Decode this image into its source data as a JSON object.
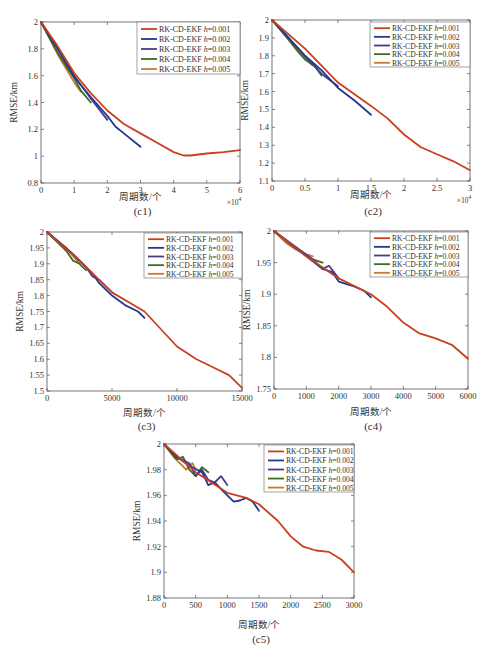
{
  "legend_labels": [
    "RK-CD-EKF h=0.001",
    "RK-CD-EKF h=0.002",
    "RK-CD-EKF h=0.003",
    "RK-CD-EKF h=0.004",
    "RK-CD-EKF h=0.005"
  ],
  "series_colors": [
    "#c8401e",
    "#1f3a8f",
    "#4a3a8c",
    "#3d6b24",
    "#c87a32"
  ],
  "chart_data": [
    {
      "type": "line",
      "panel": "(c1)",
      "xlabel": "周期数/个",
      "ylabel": "RMSE/km",
      "xlim": [
        0,
        60000
      ],
      "ylim": [
        0.8,
        2
      ],
      "x_exponent": "×10^4",
      "xticks": [
        0,
        10000,
        20000,
        30000,
        40000,
        50000,
        60000
      ],
      "xtick_labels": [
        "0",
        "1",
        "2",
        "3",
        "4",
        "5",
        "6"
      ],
      "yticks": [
        0.8,
        1,
        1.2,
        1.4,
        1.6,
        1.8,
        2
      ],
      "ytick_labels": [
        "0.8",
        "1",
        "1.2",
        "1.4",
        "1.6",
        "1.8",
        "2"
      ],
      "legend_position": "upper right",
      "series": [
        {
          "name": "RK-CD-EKF h=0.001",
          "x": [
            0,
            5000,
            10000,
            15000,
            20000,
            25000,
            30000,
            35000,
            40000,
            43000,
            45000,
            50000,
            55000,
            60000
          ],
          "y": [
            2,
            1.82,
            1.62,
            1.47,
            1.34,
            1.24,
            1.17,
            1.1,
            1.03,
            1.005,
            1.005,
            1.02,
            1.03,
            1.045
          ]
        },
        {
          "name": "RK-CD-EKF h=0.002",
          "x": [
            0,
            5000,
            10000,
            15000,
            20000,
            22500,
            25000,
            30000
          ],
          "y": [
            2,
            1.8,
            1.59,
            1.44,
            1.3,
            1.22,
            1.17,
            1.07
          ]
        },
        {
          "name": "RK-CD-EKF h=0.003",
          "x": [
            0,
            5000,
            10000,
            15000,
            20000
          ],
          "y": [
            2,
            1.8,
            1.6,
            1.43,
            1.27
          ]
        },
        {
          "name": "RK-CD-EKF h=0.004",
          "x": [
            0,
            5000,
            10000,
            12000,
            15000
          ],
          "y": [
            2,
            1.77,
            1.58,
            1.49,
            1.4
          ]
        },
        {
          "name": "RK-CD-EKF h=0.005",
          "x": [
            0,
            5000,
            10000,
            12000
          ],
          "y": [
            2,
            1.76,
            1.55,
            1.48
          ]
        }
      ]
    },
    {
      "type": "line",
      "panel": "(c2)",
      "xlabel": "周期数/个",
      "ylabel": "RMSE/km",
      "xlim": [
        0,
        30000
      ],
      "ylim": [
        1.1,
        2
      ],
      "x_exponent": "×10^4",
      "xticks": [
        0,
        5000,
        10000,
        15000,
        20000,
        25000,
        30000
      ],
      "xtick_labels": [
        "0",
        "0.5",
        "1",
        "1.5",
        "2",
        "2.5",
        "3"
      ],
      "yticks": [
        1.1,
        1.2,
        1.3,
        1.4,
        1.5,
        1.6,
        1.7,
        1.8,
        1.9,
        2
      ],
      "ytick_labels": [
        "1.1",
        "1.2",
        "1.3",
        "1.4",
        "1.5",
        "1.6",
        "1.7",
        "1.8",
        "1.9",
        "2"
      ],
      "legend_position": "upper right",
      "series": [
        {
          "name": "RK-CD-EKF h=0.001",
          "x": [
            0,
            5000,
            10000,
            15000,
            17500,
            20000,
            22500,
            25000,
            27500,
            30000
          ],
          "y": [
            2,
            1.84,
            1.65,
            1.52,
            1.45,
            1.36,
            1.29,
            1.25,
            1.21,
            1.16
          ]
        },
        {
          "name": "RK-CD-EKF h=0.002",
          "x": [
            0,
            2500,
            5000,
            7500,
            10000,
            12500,
            15000
          ],
          "y": [
            2,
            1.9,
            1.8,
            1.72,
            1.62,
            1.55,
            1.47
          ]
        },
        {
          "name": "RK-CD-EKF h=0.003",
          "x": [
            0,
            2500,
            5000,
            7500,
            10000
          ],
          "y": [
            2,
            1.9,
            1.8,
            1.7,
            1.63
          ]
        },
        {
          "name": "RK-CD-EKF h=0.004",
          "x": [
            0,
            2500,
            4000,
            5000,
            6500,
            7500
          ],
          "y": [
            2,
            1.89,
            1.82,
            1.78,
            1.74,
            1.69
          ]
        },
        {
          "name": "RK-CD-EKF h=0.005",
          "x": [
            0,
            2500,
            4000,
            5000,
            6000
          ],
          "y": [
            2,
            1.9,
            1.83,
            1.79,
            1.75
          ]
        }
      ]
    },
    {
      "type": "line",
      "panel": "(c3)",
      "xlabel": "周期数/个",
      "ylabel": "RMSE/km",
      "xlim": [
        0,
        15000
      ],
      "ylim": [
        1.5,
        2
      ],
      "xticks": [
        0,
        5000,
        10000,
        15000
      ],
      "xtick_labels": [
        "0",
        "5000",
        "10000",
        "15000"
      ],
      "yticks": [
        1.5,
        1.55,
        1.6,
        1.65,
        1.7,
        1.75,
        1.8,
        1.85,
        1.9,
        1.95,
        2
      ],
      "ytick_labels": [
        "1.5",
        "1.55",
        "1.6",
        "1.65",
        "1.7",
        "1.75",
        "1.8",
        "1.85",
        "1.9",
        "1.95",
        "2"
      ],
      "legend_position": "upper right",
      "series": [
        {
          "name": "RK-CD-EKF h=0.001",
          "x": [
            0,
            2500,
            5000,
            7500,
            10000,
            11500,
            13000,
            14000,
            15000
          ],
          "y": [
            2,
            1.91,
            1.81,
            1.75,
            1.64,
            1.6,
            1.57,
            1.55,
            1.51
          ]
        },
        {
          "name": "RK-CD-EKF h=0.002",
          "x": [
            0,
            2000,
            3500,
            4000,
            5000,
            6000,
            7000,
            7500
          ],
          "y": [
            2,
            1.93,
            1.87,
            1.84,
            1.8,
            1.77,
            1.75,
            1.73
          ]
        },
        {
          "name": "RK-CD-EKF h=0.003",
          "x": [
            0,
            2000,
            3000,
            3500,
            4000,
            5000
          ],
          "y": [
            2,
            1.93,
            1.89,
            1.86,
            1.85,
            1.81
          ]
        },
        {
          "name": "RK-CD-EKF h=0.004",
          "x": [
            0,
            1500,
            2000,
            2500,
            3000
          ],
          "y": [
            2,
            1.94,
            1.91,
            1.9,
            1.88
          ]
        },
        {
          "name": "RK-CD-EKF h=0.005",
          "x": [
            0,
            1500,
            2500
          ],
          "y": [
            2,
            1.95,
            1.9
          ]
        }
      ]
    },
    {
      "type": "line",
      "panel": "(c4)",
      "xlabel": "周期数/个",
      "ylabel": "RMSE/km",
      "xlim": [
        0,
        6000
      ],
      "ylim": [
        1.75,
        2
      ],
      "xticks": [
        0,
        1000,
        2000,
        3000,
        4000,
        5000,
        6000
      ],
      "xtick_labels": [
        "0",
        "1000",
        "2000",
        "3000",
        "4000",
        "5000",
        "6000"
      ],
      "yticks": [
        1.75,
        1.8,
        1.85,
        1.9,
        1.95,
        2
      ],
      "ytick_labels": [
        "1.75",
        "1.8",
        "1.85",
        "1.9",
        "1.95",
        "2"
      ],
      "legend_position": "upper right",
      "series": [
        {
          "name": "RK-CD-EKF h=0.001",
          "x": [
            0,
            1000,
            2000,
            3000,
            3500,
            4000,
            4500,
            5000,
            5500,
            6000
          ],
          "y": [
            2,
            1.96,
            1.925,
            1.9,
            1.88,
            1.855,
            1.838,
            1.83,
            1.82,
            1.798
          ]
        },
        {
          "name": "RK-CD-EKF h=0.002",
          "x": [
            0,
            1000,
            1500,
            1800,
            2000,
            2500,
            2800,
            3000
          ],
          "y": [
            2,
            1.96,
            1.94,
            1.935,
            1.92,
            1.912,
            1.905,
            1.895
          ]
        },
        {
          "name": "RK-CD-EKF h=0.003",
          "x": [
            0,
            800,
            1200,
            1500,
            1700,
            2000
          ],
          "y": [
            2,
            1.97,
            1.955,
            1.94,
            1.945,
            1.925
          ]
        },
        {
          "name": "RK-CD-EKF h=0.004",
          "x": [
            0,
            600,
            900,
            1200,
            1500
          ],
          "y": [
            2,
            1.975,
            1.965,
            1.955,
            1.95
          ]
        },
        {
          "name": "RK-CD-EKF h=0.005",
          "x": [
            0,
            400,
            700,
            900,
            1200
          ],
          "y": [
            2,
            1.98,
            1.97,
            1.965,
            1.96
          ]
        }
      ]
    },
    {
      "type": "line",
      "panel": "(c5)",
      "xlabel": "周期数/个",
      "ylabel": "RMSE/km",
      "xlim": [
        0,
        3000
      ],
      "ylim": [
        1.88,
        2
      ],
      "xticks": [
        0,
        500,
        1000,
        1500,
        2000,
        2500,
        3000
      ],
      "xtick_labels": [
        "0",
        "500",
        "1000",
        "1500",
        "2000",
        "2500",
        "3000"
      ],
      "yticks": [
        1.88,
        1.9,
        1.92,
        1.94,
        1.96,
        1.98,
        2
      ],
      "ytick_labels": [
        "1.88",
        "1.9",
        "1.92",
        "1.94",
        "1.96",
        "1.98",
        "2"
      ],
      "legend_position": "upper right",
      "series": [
        {
          "name": "RK-CD-EKF h=0.001",
          "x": [
            0,
            500,
            1000,
            1300,
            1500,
            1800,
            2000,
            2200,
            2400,
            2600,
            2800,
            3000
          ],
          "y": [
            2,
            1.978,
            1.962,
            1.958,
            1.953,
            1.94,
            1.928,
            1.92,
            1.917,
            1.916,
            1.91,
            1.9
          ]
        },
        {
          "name": "RK-CD-EKF h=0.002",
          "x": [
            0,
            200,
            400,
            600,
            700,
            800,
            1000,
            1100,
            1200,
            1300,
            1400,
            1500
          ],
          "y": [
            2,
            1.99,
            1.983,
            1.978,
            1.968,
            1.97,
            1.96,
            1.955,
            1.956,
            1.958,
            1.955,
            1.948
          ]
        },
        {
          "name": "RK-CD-EKF h=0.003",
          "x": [
            0,
            200,
            400,
            500,
            600,
            700,
            800,
            900,
            1000
          ],
          "y": [
            2,
            1.99,
            1.985,
            1.975,
            1.98,
            1.972,
            1.97,
            1.975,
            1.968
          ]
        },
        {
          "name": "RK-CD-EKF h=0.004",
          "x": [
            0,
            200,
            300,
            400,
            500,
            600,
            700
          ],
          "y": [
            2,
            1.988,
            1.99,
            1.98,
            1.975,
            1.982,
            1.978
          ]
        },
        {
          "name": "RK-CD-EKF h=0.005",
          "x": [
            0,
            150,
            250,
            350,
            450,
            500
          ],
          "y": [
            2,
            1.99,
            1.985,
            1.98,
            1.985,
            1.98
          ]
        }
      ]
    }
  ],
  "panels_layout": [
    {
      "left": 41,
      "top": 22,
      "right": 240,
      "bottom": 183,
      "caption_y": 205,
      "xlabel_y": 190,
      "legend": {
        "x": 137,
        "y": 22,
        "w": 103,
        "h": 52
      }
    },
    {
      "left": 272,
      "top": 20,
      "right": 470,
      "bottom": 181,
      "caption_y": 205,
      "xlabel_y": 188,
      "legend": {
        "x": 370,
        "y": 22,
        "w": 100,
        "h": 45
      }
    },
    {
      "left": 47,
      "top": 232,
      "right": 242,
      "bottom": 391,
      "caption_y": 420,
      "xlabel_y": 406,
      "legend": {
        "x": 144,
        "y": 233,
        "w": 98,
        "h": 45
      }
    },
    {
      "left": 274,
      "top": 231,
      "right": 468,
      "bottom": 389,
      "caption_y": 420,
      "xlabel_y": 405,
      "legend": {
        "x": 370,
        "y": 232,
        "w": 98,
        "h": 45
      }
    },
    {
      "left": 164,
      "top": 444,
      "right": 354,
      "bottom": 598,
      "caption_y": 633,
      "xlabel_y": 618,
      "legend": {
        "x": 264,
        "y": 445,
        "w": 90,
        "h": 47
      }
    }
  ]
}
